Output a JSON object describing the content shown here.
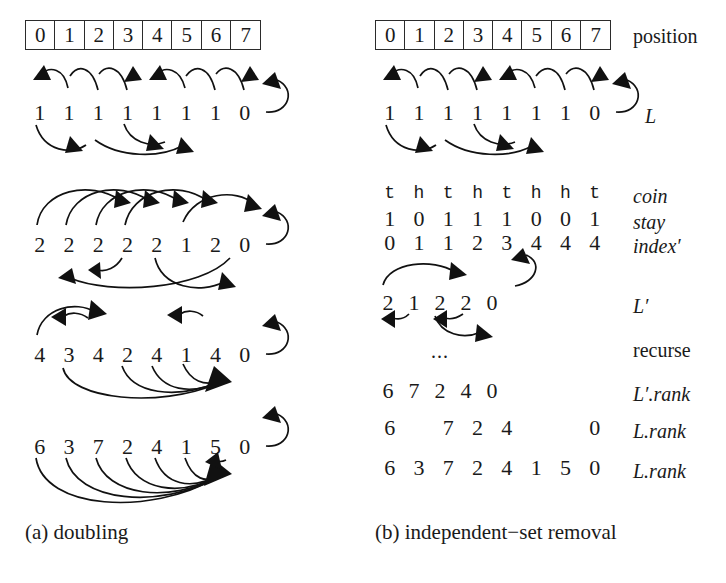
{
  "figure": {
    "panel_a": {
      "caption": "(a) doubling",
      "position_row": [
        "0",
        "1",
        "2",
        "3",
        "4",
        "5",
        "6",
        "7"
      ],
      "steps": [
        {
          "name": "step-0",
          "values": [
            "1",
            "1",
            "1",
            "1",
            "1",
            "1",
            "1",
            "0"
          ]
        },
        {
          "name": "step-1",
          "values": [
            "2",
            "2",
            "2",
            "2",
            "2",
            "1",
            "2",
            "0"
          ]
        },
        {
          "name": "step-2",
          "values": [
            "4",
            "3",
            "4",
            "2",
            "4",
            "1",
            "4",
            "0"
          ]
        },
        {
          "name": "step-3",
          "values": [
            "6",
            "3",
            "7",
            "2",
            "4",
            "1",
            "5",
            "0"
          ]
        }
      ]
    },
    "panel_b": {
      "caption": "(b) independent−set removal",
      "position_row": [
        "0",
        "1",
        "2",
        "3",
        "4",
        "5",
        "6",
        "7"
      ],
      "position_label": "position",
      "rows": [
        {
          "name": "L",
          "label": "L",
          "label_style": "italic",
          "values": [
            "1",
            "1",
            "1",
            "1",
            "1",
            "1",
            "1",
            "0"
          ]
        },
        {
          "name": "coin",
          "label": "coin",
          "label_style": "italic",
          "values": [
            "t",
            "h",
            "t",
            "h",
            "t",
            "h",
            "h",
            "t"
          ]
        },
        {
          "name": "stay",
          "label": "stay",
          "label_style": "italic",
          "values": [
            "1",
            "0",
            "1",
            "1",
            "1",
            "0",
            "0",
            "1"
          ]
        },
        {
          "name": "index",
          "label": "index′",
          "label_style": "italic",
          "values": [
            "0",
            "1",
            "1",
            "2",
            "3",
            "4",
            "4",
            "4"
          ]
        },
        {
          "name": "Lprime",
          "label": "L′",
          "label_style": "italic",
          "values": [
            "2",
            "1",
            "2",
            "2",
            "0"
          ]
        },
        {
          "name": "recurse",
          "label": "recurse",
          "label_style": "roman",
          "values": [],
          "ellipsis": "..."
        },
        {
          "name": "Lprime-rank",
          "label": "L′.rank",
          "label_style": "italic",
          "values": [
            "6",
            "7",
            "2",
            "4",
            "0"
          ]
        },
        {
          "name": "L-rank-sparse",
          "label": "L.rank",
          "label_style": "italic",
          "values": [
            "6",
            "",
            "7",
            "2",
            "4",
            "",
            "",
            "0"
          ]
        },
        {
          "name": "L-rank-full",
          "label": "L.rank",
          "label_style": "italic",
          "values": [
            "6",
            "3",
            "7",
            "2",
            "4",
            "1",
            "5",
            "0"
          ]
        }
      ]
    },
    "colors": {
      "ink": "#111111",
      "box_border": "#2b2b2b",
      "background": "#ffffff"
    }
  }
}
